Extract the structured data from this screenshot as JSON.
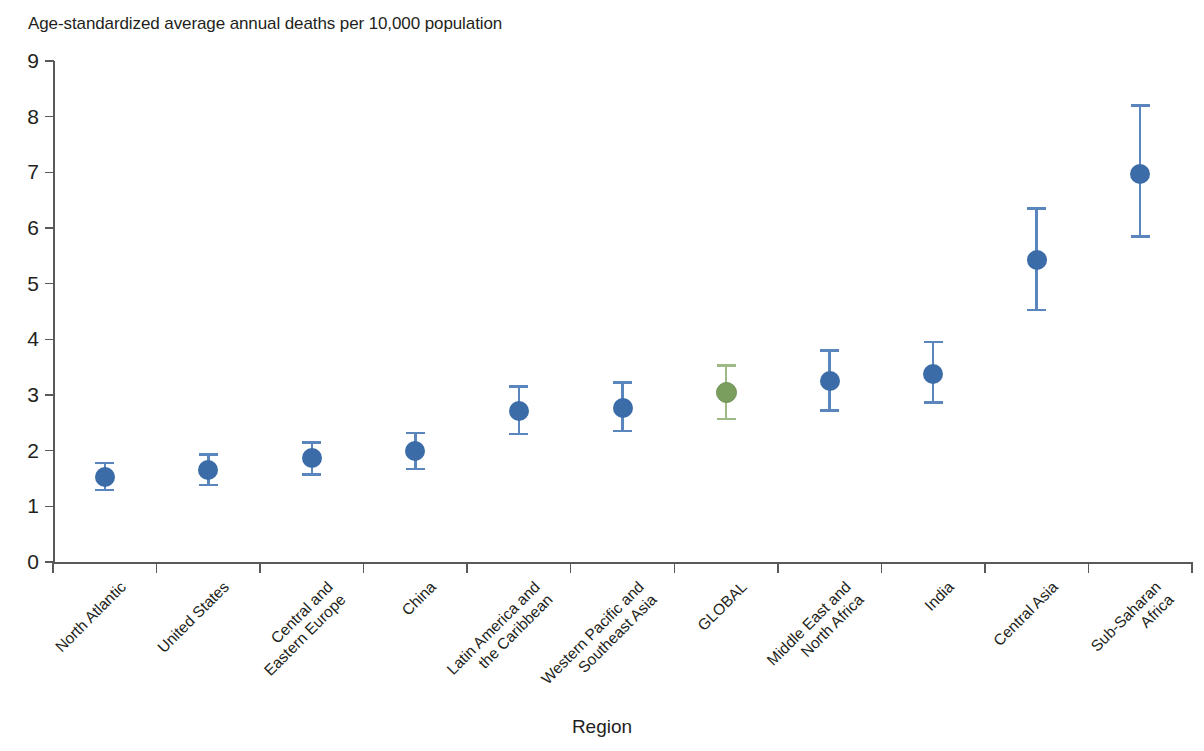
{
  "chart_data": {
    "type": "scatter",
    "title": "",
    "ylabel": "Age-standardized average annual deaths per 10,000 population",
    "xlabel": "Region",
    "ylim": [
      0,
      9
    ],
    "yticks": [
      "0",
      "1",
      "2",
      "3",
      "4",
      "5",
      "6",
      "7",
      "8",
      "9"
    ],
    "grid": false,
    "legend": "none",
    "error_bars": "95% uncertainty interval",
    "categories": [
      "North Atlantic",
      "United States",
      "Central and\nEastern Europe",
      "China",
      "Latin America and\nthe Caribbean",
      "Western Pacific and\nSoutheast Asia",
      "GLOBAL",
      "Middle East and\nNorth Africa",
      "India",
      "Central Asia",
      "Sub-Saharan\nAfrica"
    ],
    "series": [
      {
        "name": "Age-standardized average annual deaths per 10,000 population",
        "values": [
          1.53,
          1.65,
          1.87,
          2.0,
          2.72,
          2.77,
          3.05,
          3.25,
          3.37,
          5.42,
          6.97
        ],
        "lower": [
          1.29,
          1.38,
          1.57,
          1.67,
          2.3,
          2.35,
          2.57,
          2.72,
          2.87,
          4.53,
          5.85
        ],
        "upper": [
          1.78,
          1.93,
          2.15,
          2.32,
          3.15,
          3.22,
          3.53,
          3.8,
          3.95,
          6.35,
          8.2
        ]
      }
    ],
    "point_colors": [
      "#3b6ca8",
      "#3b6ca8",
      "#3b6ca8",
      "#3b6ca8",
      "#3b6ca8",
      "#3b6ca8",
      "#7a9e5e",
      "#3b6ca8",
      "#3b6ca8",
      "#3b6ca8",
      "#3b6ca8"
    ],
    "highlight_category": "GLOBAL",
    "highlight_color": "#7a9e5e",
    "default_color": "#3b6ca8",
    "whisker_colors": [
      "#5a86bd",
      "#5a86bd",
      "#5a86bd",
      "#5a86bd",
      "#5a86bd",
      "#5a86bd",
      "#9dba86",
      "#5a86bd",
      "#5a86bd",
      "#5a86bd",
      "#5a86bd"
    ],
    "axis_color": "#58595b"
  }
}
